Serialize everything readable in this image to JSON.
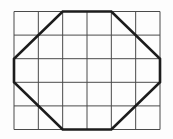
{
  "figure": {
    "canvas": {
      "width": 173,
      "height": 139
    },
    "background_color": "#fdfdfd",
    "grid": {
      "columns": 6,
      "rows": 5,
      "x0": 14,
      "y0": 11.5,
      "x1": 160,
      "y1": 129.5,
      "line_color": "#4a4a4a",
      "line_width": 1
    },
    "octagon": {
      "vertices_grid_units": [
        [
          2,
          0
        ],
        [
          4,
          0
        ],
        [
          6,
          2
        ],
        [
          6,
          3
        ],
        [
          4,
          5
        ],
        [
          2,
          5
        ],
        [
          0,
          3
        ],
        [
          0,
          2
        ]
      ],
      "stroke_color": "#1c1c1c",
      "stroke_width": 2.6,
      "fill": "none"
    }
  }
}
